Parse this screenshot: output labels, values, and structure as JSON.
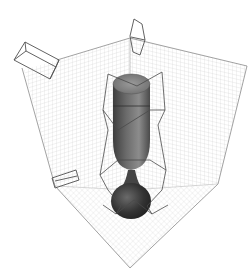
{
  "scene": {
    "description": "3D render of a goblet inside a gridded room corner with light gizmos",
    "background": "#ffffff",
    "grid_color": "#c8c8c8",
    "edge_color": "#8a8a8a",
    "gizmo_color": "#505050",
    "goblet_colors": {
      "cup_dark": "#3e3e3e",
      "cup_mid": "#777777",
      "cup_light": "#a8a8a8",
      "base": "#2a2a2a"
    },
    "objects": [
      {
        "name": "left-wall",
        "type": "grid-plane"
      },
      {
        "name": "right-wall",
        "type": "grid-plane"
      },
      {
        "name": "floor",
        "type": "grid-plane"
      },
      {
        "name": "goblet",
        "type": "mesh"
      },
      {
        "name": "light-box-top-left",
        "type": "light-gizmo"
      },
      {
        "name": "light-top-center",
        "type": "light-gizmo"
      },
      {
        "name": "light-bottom-left",
        "type": "light-gizmo"
      },
      {
        "name": "bounding-cage",
        "type": "wireframe"
      }
    ]
  }
}
